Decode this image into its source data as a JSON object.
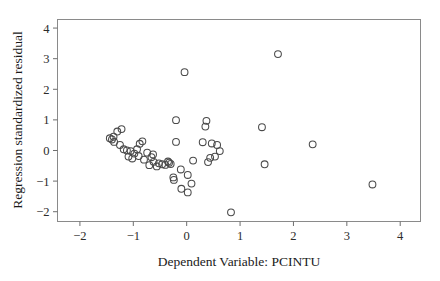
{
  "figure": {
    "background_color": "#ffffff",
    "frame_color": "#8a8a8a",
    "marker_color": "#4a4a4a",
    "text_color": "#1a1a1a"
  },
  "chart_data": {
    "type": "scatter",
    "title": "",
    "subtitle": "",
    "xlabel": "Dependent Variable: PCINTU",
    "ylabel": "Regression standardized residual",
    "xlim": [
      -2.42,
      4.38
    ],
    "ylim": [
      -2.32,
      4.28
    ],
    "xticks": [
      -2,
      -1,
      0,
      1,
      2,
      3,
      4
    ],
    "xtick_labels": [
      "−2",
      "−1",
      "0",
      "1",
      "2",
      "3",
      "4"
    ],
    "yticks": [
      -2,
      -1,
      0,
      1,
      2,
      3,
      4
    ],
    "ytick_labels": [
      "−2",
      "−1",
      "0",
      "1",
      "2",
      "3",
      "4"
    ],
    "grid": false,
    "legend": null,
    "marker": "open-circle",
    "marker_size": 4.6,
    "n_points": 56,
    "points": [
      [
        1.71,
        3.15
      ],
      [
        -0.04,
        2.56
      ],
      [
        -0.2,
        0.99
      ],
      [
        0.37,
        0.97
      ],
      [
        0.35,
        0.78
      ],
      [
        1.41,
        0.76
      ],
      [
        -1.22,
        0.7
      ],
      [
        -1.3,
        0.62
      ],
      [
        -1.37,
        0.45
      ],
      [
        -1.4,
        0.36
      ],
      [
        -1.36,
        0.28
      ],
      [
        2.36,
        0.2
      ],
      [
        -0.83,
        0.3
      ],
      [
        -0.2,
        0.28
      ],
      [
        0.3,
        0.27
      ],
      [
        0.47,
        0.23
      ],
      [
        0.57,
        0.18
      ],
      [
        -1.25,
        0.18
      ],
      [
        -1.18,
        0.04
      ],
      [
        -1.12,
        0.0
      ],
      [
        -1.05,
        -0.02
      ],
      [
        -0.93,
        0.04
      ],
      [
        -0.98,
        -0.1
      ],
      [
        -0.74,
        -0.07
      ],
      [
        -0.63,
        -0.13
      ],
      [
        -1.09,
        -0.2
      ],
      [
        -1.02,
        -0.26
      ],
      [
        0.62,
        -0.02
      ],
      [
        0.53,
        -0.2
      ],
      [
        0.4,
        -0.38
      ],
      [
        -0.62,
        -0.37
      ],
      [
        -0.52,
        -0.42
      ],
      [
        -0.46,
        -0.45
      ],
      [
        -0.4,
        -0.47
      ],
      [
        -0.35,
        -0.36
      ],
      [
        -0.33,
        -0.4
      ],
      [
        -0.7,
        -0.48
      ],
      [
        1.46,
        -0.45
      ],
      [
        -0.25,
        -0.88
      ],
      [
        -0.24,
        -0.96
      ],
      [
        -0.11,
        -0.62
      ],
      [
        0.02,
        -0.8
      ],
      [
        0.09,
        -1.08
      ],
      [
        -0.1,
        -1.25
      ],
      [
        0.02,
        -1.37
      ],
      [
        3.48,
        -1.11
      ],
      [
        0.83,
        -2.02
      ],
      [
        -1.44,
        0.4
      ],
      [
        -0.88,
        0.22
      ],
      [
        -0.9,
        -0.18
      ],
      [
        -0.8,
        -0.3
      ],
      [
        -0.56,
        -0.52
      ],
      [
        -0.3,
        -0.44
      ],
      [
        0.44,
        -0.24
      ],
      [
        0.12,
        -0.33
      ],
      [
        -0.66,
        -0.22
      ]
    ]
  }
}
